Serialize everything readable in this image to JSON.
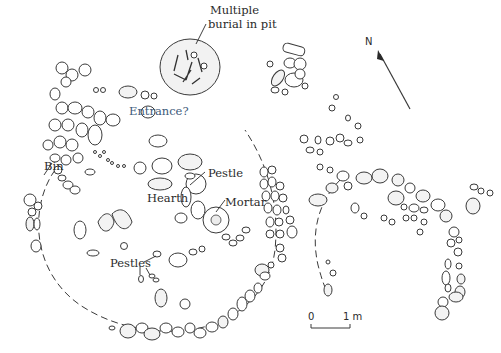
{
  "figure": {
    "type": "archaeological site plan",
    "background": "#ffffff",
    "ink_color": "#2a2a2a"
  },
  "labels": {
    "burial": "Multiple\nburial in pit",
    "burial_line1": "Multiple",
    "burial_line2": "burial in pit",
    "entrance": "Entrance?",
    "bin": "Bin",
    "pestle": "Pestle",
    "hearth": "Hearth",
    "mortar": "Mortar",
    "pestles": "Pestles"
  },
  "north_arrow": {
    "label": "N"
  },
  "scale_bar": {
    "start_label": "0",
    "end_label": "1 m"
  },
  "colors": {
    "entrance_label": "#3d5a7a"
  }
}
